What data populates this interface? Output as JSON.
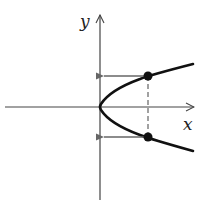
{
  "diagram": {
    "type": "parabola-horizontal",
    "equation_hint": "x = y^2 (opens right)",
    "axes": {
      "x_label": "x",
      "y_label": "y"
    },
    "points": [
      {
        "name": "upper-point",
        "note": "intersection of vertical dashed line with upper branch"
      },
      {
        "name": "lower-point",
        "note": "intersection of vertical dashed line with lower branch"
      }
    ],
    "arrows": [
      {
        "from": "upper-point",
        "direction": "left",
        "to": "y-axis"
      },
      {
        "from": "lower-point",
        "direction": "left",
        "to": "y-axis"
      }
    ],
    "dashed_line": "vertical line joining the two points",
    "colors": {
      "curve": "#111111",
      "axes": "#444444",
      "arrows": "#666666"
    }
  }
}
